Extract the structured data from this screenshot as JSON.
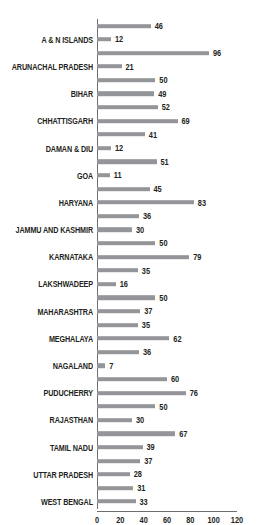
{
  "chart_data": {
    "type": "bar",
    "orientation": "horizontal",
    "title": "",
    "subtitle": "",
    "xlabel": "",
    "ylabel": "",
    "xlim": [
      0,
      120
    ],
    "xticks": [
      0,
      20,
      40,
      60,
      80,
      100,
      120
    ],
    "grid": false,
    "legend": null,
    "bar_color": "#939598",
    "axis_color": "#6d6e71",
    "text_color": "#231f20",
    "categories": [
      "",
      "A & N ISLANDS",
      "",
      "ARUNACHAL PRADESH",
      "",
      "BIHAR",
      "",
      "CHHATTISGARH",
      "",
      "DAMAN & DIU",
      "",
      "GOA",
      "",
      "HARYANA",
      "",
      "JAMMU AND KASHMIR",
      "",
      "KARNATAKA",
      "",
      "LAKSHWADEEP",
      "",
      "MAHARASHTRA",
      "",
      "MEGHALAYA",
      "",
      "NAGALAND",
      "",
      "PUDUCHERRY",
      "",
      "RAJASTHAN",
      "",
      "TAMIL NADU",
      "",
      "UTTAR PRADESH",
      "",
      "WEST BENGAL"
    ],
    "values": [
      46,
      12,
      96,
      21,
      50,
      49,
      52,
      69,
      41,
      12,
      51,
      11,
      45,
      83,
      36,
      30,
      50,
      79,
      35,
      16,
      50,
      37,
      35,
      62,
      36,
      7,
      60,
      76,
      50,
      30,
      67,
      39,
      37,
      28,
      31,
      33
    ]
  }
}
